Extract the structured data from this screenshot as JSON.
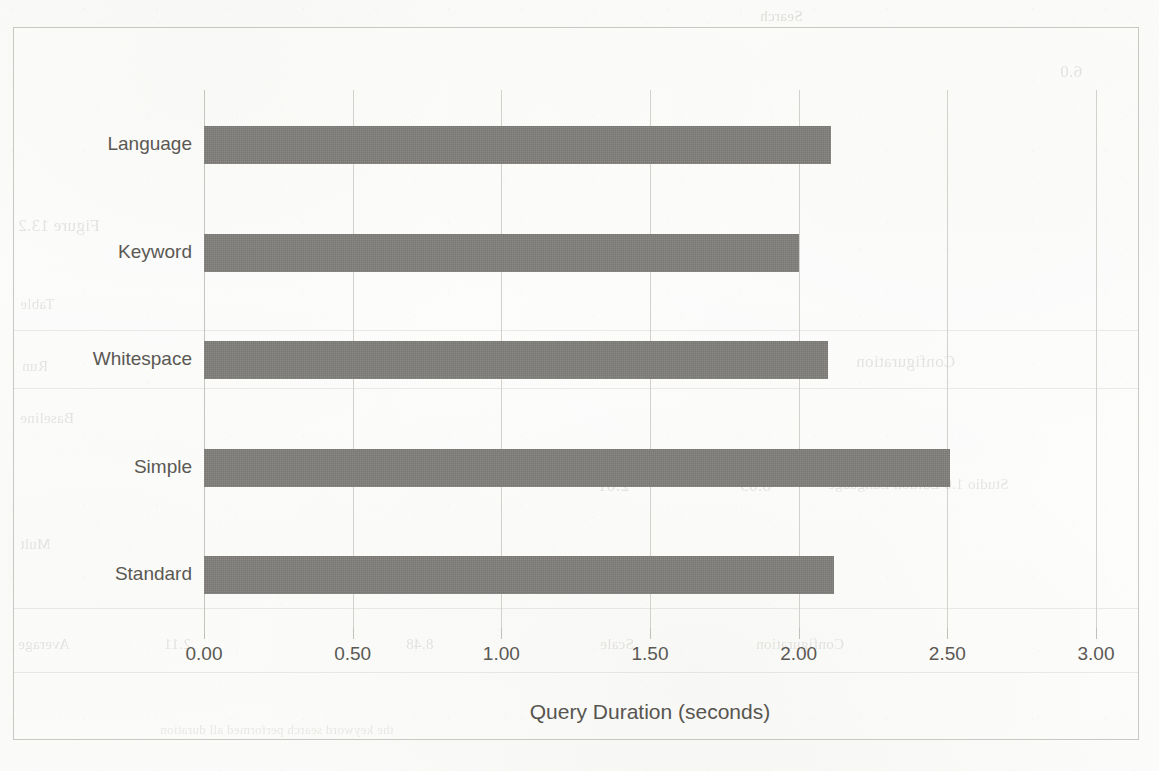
{
  "chart_data": {
    "type": "bar",
    "orientation": "horizontal",
    "title": "",
    "subtitle": "",
    "xlabel": "Query Duration (seconds)",
    "ylabel": "",
    "categories": [
      "Standard",
      "Simple",
      "Whitespace",
      "Keyword",
      "Language"
    ],
    "values": [
      2.12,
      2.51,
      2.1,
      2.0,
      2.11
    ],
    "series": [
      {
        "name": "Query Duration",
        "values": [
          2.12,
          2.51,
          2.1,
          2.0,
          2.11
        ]
      }
    ],
    "xlim": [
      0.0,
      3.0
    ],
    "xticks": [
      0.0,
      0.5,
      1.0,
      1.5,
      2.0,
      2.5,
      3.0
    ],
    "xtick_labels": [
      "0.00",
      "0.50",
      "1.00",
      "1.50",
      "2.00",
      "2.50",
      "3.00"
    ],
    "grid": "vertical",
    "legend": "none",
    "bar_color": "#7f7d79",
    "axis_text_color": "#5a5853",
    "gridline_color": "#d3d1cb",
    "frame_color": "#c9c7c1",
    "background_color": "#fdfdfc"
  },
  "bleed_through": {
    "note": "faint mirrored show-through text from the reverse side of the scanned page",
    "fragments": [
      {
        "text": "Search",
        "x": 760,
        "y": 8,
        "size": "s1"
      },
      {
        "text": "6.0",
        "x": 1060,
        "y": 62,
        "size": "s2"
      },
      {
        "text": "Figure 13.2",
        "x": 18,
        "y": 216,
        "size": "s2"
      },
      {
        "text": "Table",
        "x": 20,
        "y": 296,
        "size": "s1"
      },
      {
        "text": "Run",
        "x": 22,
        "y": 358,
        "size": "s1"
      },
      {
        "text": "Time (min)",
        "x": 556,
        "y": 352,
        "size": "s2"
      },
      {
        "text": "Scale",
        "x": 728,
        "y": 352,
        "size": "s2"
      },
      {
        "text": "Configuration",
        "x": 856,
        "y": 352,
        "size": "s2"
      },
      {
        "text": "Baseline",
        "x": 20,
        "y": 410,
        "size": "s1"
      },
      {
        "text": "2.61",
        "x": 598,
        "y": 476,
        "size": "s2"
      },
      {
        "text": "8.09",
        "x": 740,
        "y": 476,
        "size": "s2"
      },
      {
        "text": "Studio 1.0 Edition Language",
        "x": 828,
        "y": 476,
        "size": "s1"
      },
      {
        "text": "Mult",
        "x": 20,
        "y": 536,
        "size": "s1"
      },
      {
        "text": "Average",
        "x": 18,
        "y": 636,
        "size": "s1"
      },
      {
        "text": "2.11",
        "x": 164,
        "y": 636,
        "size": "s1"
      },
      {
        "text": "8.48",
        "x": 406,
        "y": 636,
        "size": "s1"
      },
      {
        "text": "Scale",
        "x": 600,
        "y": 636,
        "size": "s1"
      },
      {
        "text": "Configuration",
        "x": 756,
        "y": 636,
        "size": "s1"
      },
      {
        "text": "the keyword search performed all duration",
        "x": 160,
        "y": 722,
        "size": "s3"
      }
    ],
    "rules": [
      {
        "x": 14,
        "y": 330,
        "width": 1124
      },
      {
        "x": 14,
        "y": 388,
        "width": 1124
      },
      {
        "x": 14,
        "y": 608,
        "width": 1124
      },
      {
        "x": 14,
        "y": 672,
        "width": 1124
      }
    ]
  }
}
